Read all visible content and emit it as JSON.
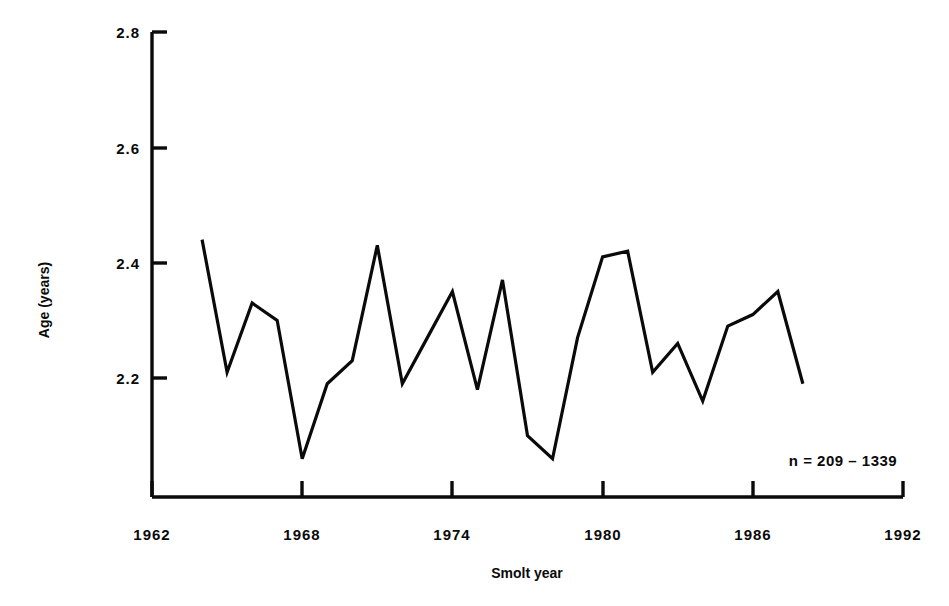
{
  "chart_data": {
    "type": "line",
    "title": "",
    "xlabel": "Smolt year",
    "ylabel": "Age (years)",
    "xlim": [
      1962,
      1992
    ],
    "ylim": [
      2.0,
      2.8
    ],
    "grid": false,
    "legend": null,
    "xticks": [
      1962,
      1968,
      1974,
      1980,
      1986,
      1992
    ],
    "xtick_labels": [
      "1962",
      "1968",
      "1974",
      "1980",
      "1986",
      "1992"
    ],
    "yticks": [
      2.2,
      2.4,
      2.6,
      2.8
    ],
    "ytick_labels": [
      "2.2",
      "2.4",
      "2.6",
      "2.8"
    ],
    "annotations": [
      {
        "text": "n = 209 – 1339",
        "x": 1986,
        "y": 2.08
      }
    ],
    "x": [
      1964,
      1965,
      1966,
      1967,
      1968,
      1969,
      1970,
      1971,
      1972,
      1973,
      1974,
      1975,
      1976,
      1977,
      1978,
      1979,
      1980,
      1981,
      1982,
      1983,
      1984,
      1985,
      1986,
      1987,
      1988
    ],
    "values": [
      2.44,
      2.21,
      2.33,
      2.3,
      2.06,
      2.19,
      2.23,
      2.43,
      2.19,
      2.27,
      2.35,
      2.18,
      2.37,
      2.1,
      2.06,
      2.27,
      2.41,
      2.42,
      2.21,
      2.26,
      2.16,
      2.29,
      2.31,
      2.35,
      2.19
    ],
    "series": [
      {
        "name": "Age at return",
        "color": "#0a0a0a",
        "values": [
          2.44,
          2.21,
          2.33,
          2.3,
          2.06,
          2.19,
          2.23,
          2.43,
          2.19,
          2.27,
          2.35,
          2.18,
          2.37,
          2.1,
          2.06,
          2.27,
          2.41,
          2.42,
          2.21,
          2.26,
          2.16,
          2.29,
          2.31,
          2.35,
          2.19
        ]
      }
    ]
  },
  "axes": {
    "y_title": "Age (years)",
    "x_title": "Smolt year",
    "y_tick_labels": [
      "2.8",
      "2.6",
      "2.4",
      "2.2"
    ],
    "x_tick_labels": [
      "1962",
      "1968",
      "1974",
      "1980",
      "1986",
      "1992"
    ]
  },
  "annotation": {
    "sample_size": "n = 209 – 1339"
  },
  "colors": {
    "line": "#0a0a0a",
    "axis": "#0a0a0a",
    "background": "#ffffff"
  }
}
